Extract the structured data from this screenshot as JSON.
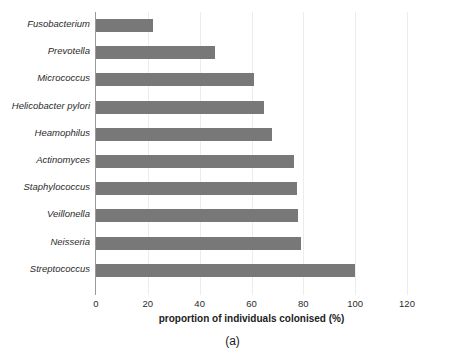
{
  "chart_data": {
    "type": "bar",
    "orientation": "horizontal",
    "title": "",
    "subtitle": "",
    "xlabel": "proportion of individuals colonised (%)",
    "ylabel": "",
    "xlim": [
      0,
      120
    ],
    "xticks": [
      0,
      20,
      40,
      60,
      80,
      100,
      120
    ],
    "grid": true,
    "grid_axis": "x",
    "legend": false,
    "legend_position": "none",
    "bar_color": "#787878",
    "categories": [
      "Fusobacterium",
      "Prevotella",
      "Micrococcus",
      "Helicobacter pylori",
      "Heamophilus",
      "Actinomyces",
      "Staphylococcus",
      "Veillonella",
      "Neisseria",
      "Streptococcus"
    ],
    "values": [
      22,
      46,
      61,
      65,
      68,
      76.5,
      77.5,
      78,
      79,
      100
    ],
    "caption": "(a)"
  },
  "figure": {
    "caption": "(a)",
    "axis_title": "proportion of individuals colonised (%)"
  }
}
